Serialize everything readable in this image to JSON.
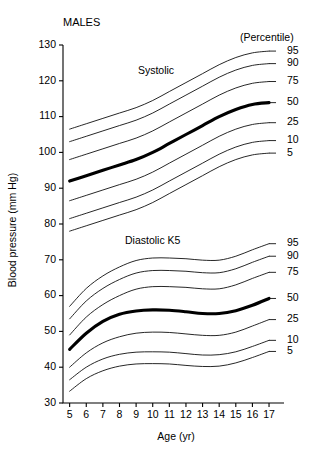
{
  "chart_data": {
    "type": "line",
    "title": "MALES",
    "xlabel": "Age (yr)",
    "ylabel": "Blood pressure (mm Hg)",
    "legend_header": "(Percentile)",
    "legend_position": "right",
    "grid": false,
    "xlim": [
      4.6,
      17.6
    ],
    "ylim": [
      30,
      130
    ],
    "xticks": [
      5,
      6,
      7,
      8,
      9,
      10,
      11,
      12,
      13,
      14,
      15,
      16,
      17
    ],
    "yticks": [
      30,
      40,
      50,
      60,
      70,
      80,
      90,
      100,
      110,
      120,
      130
    ],
    "x": [
      5,
      6,
      7,
      8,
      9,
      10,
      11,
      12,
      13,
      14,
      15,
      16,
      17
    ],
    "groups": [
      {
        "name": "Systolic",
        "label": "Systolic",
        "label_x": 10.2,
        "label_y": 122.0,
        "series": [
          {
            "name": "95",
            "percentile": 95,
            "bold": false,
            "values": [
              106.5,
              108.0,
              109.5,
              111.0,
              112.5,
              114.5,
              117.0,
              119.5,
              122.0,
              124.5,
              126.5,
              127.8,
              128.3
            ]
          },
          {
            "name": "90",
            "percentile": 90,
            "bold": false,
            "values": [
              103.0,
              104.5,
              106.0,
              107.5,
              109.0,
              111.0,
              113.5,
              116.0,
              118.5,
              121.0,
              123.0,
              124.3,
              124.8
            ]
          },
          {
            "name": "75",
            "percentile": 75,
            "bold": false,
            "values": [
              98.0,
              99.5,
              101.0,
              102.5,
              104.0,
              106.0,
              108.5,
              111.0,
              113.5,
              116.0,
              118.0,
              119.3,
              119.8
            ]
          },
          {
            "name": "50",
            "percentile": 50,
            "bold": true,
            "values": [
              92.0,
              93.5,
              95.0,
              96.5,
              98.0,
              100.0,
              102.5,
              105.0,
              107.5,
              110.0,
              112.0,
              113.4,
              113.9
            ]
          },
          {
            "name": "25",
            "percentile": 25,
            "bold": false,
            "values": [
              86.5,
              88.0,
              89.5,
              91.0,
              92.5,
              94.5,
              97.0,
              99.5,
              102.0,
              104.5,
              106.5,
              107.8,
              108.3
            ]
          },
          {
            "name": "10",
            "percentile": 10,
            "bold": false,
            "values": [
              81.5,
              83.0,
              84.5,
              86.0,
              87.5,
              89.5,
              92.0,
              94.5,
              97.0,
              99.5,
              101.5,
              102.8,
              103.3
            ]
          },
          {
            "name": "5",
            "percentile": 5,
            "bold": false,
            "values": [
              78.0,
              79.5,
              81.0,
              82.5,
              84.0,
              86.0,
              88.5,
              91.0,
              93.5,
              96.0,
              98.0,
              99.3,
              99.8
            ]
          }
        ]
      },
      {
        "name": "Diastolic K5",
        "label": "Diastolic K5",
        "label_x": 10.0,
        "label_y": 74.5,
        "series": [
          {
            "name": "95",
            "percentile": 95,
            "bold": false,
            "values": [
              57.0,
              62.0,
              65.5,
              68.0,
              69.8,
              70.5,
              70.5,
              70.3,
              69.9,
              69.9,
              71.0,
              72.8,
              74.5
            ]
          },
          {
            "name": "90",
            "percentile": 90,
            "bold": false,
            "values": [
              53.5,
              58.5,
              62.0,
              64.5,
              66.3,
              67.0,
              67.0,
              66.8,
              66.4,
              66.4,
              67.5,
              69.3,
              71.0
            ]
          },
          {
            "name": "75",
            "percentile": 75,
            "bold": false,
            "values": [
              49.0,
              54.0,
              57.5,
              60.0,
              61.8,
              62.5,
              62.5,
              62.3,
              61.9,
              61.9,
              63.0,
              64.8,
              66.5
            ]
          },
          {
            "name": "50",
            "percentile": 50,
            "bold": true,
            "values": [
              45.0,
              49.5,
              52.8,
              54.8,
              55.7,
              56.0,
              55.9,
              55.5,
              55.0,
              55.0,
              55.8,
              57.3,
              59.2
            ]
          },
          {
            "name": "25",
            "percentile": 25,
            "bold": false,
            "values": [
              40.0,
              44.0,
              46.8,
              48.5,
              49.5,
              49.8,
              49.7,
              49.3,
              48.9,
              48.9,
              49.8,
              51.5,
              53.3
            ]
          },
          {
            "name": "10",
            "percentile": 10,
            "bold": false,
            "values": [
              36.5,
              40.0,
              42.3,
              43.6,
              44.2,
              44.3,
              44.2,
              43.8,
              43.4,
              43.5,
              44.3,
              45.8,
              47.5
            ]
          },
          {
            "name": "5",
            "percentile": 5,
            "bold": false,
            "values": [
              33.3,
              36.8,
              39.0,
              40.3,
              40.9,
              41.0,
              40.9,
              40.5,
              40.2,
              40.3,
              41.2,
              42.7,
              44.4
            ]
          }
        ]
      }
    ]
  }
}
